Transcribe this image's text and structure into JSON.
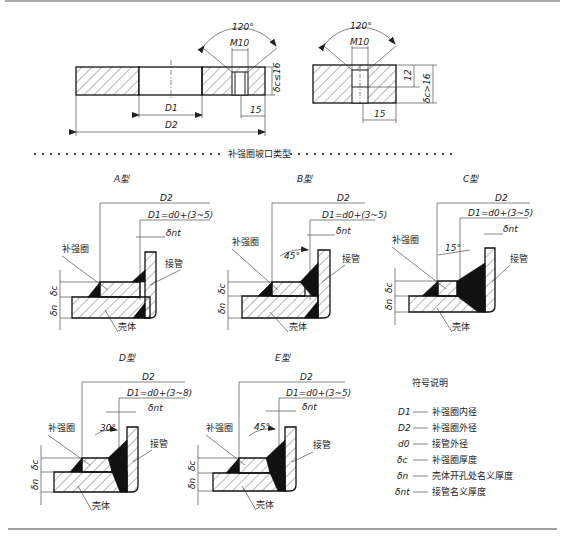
{
  "top_view_1": {
    "angle": "120°",
    "thread": "M10",
    "thickness_label": "δc≤16",
    "inner_dia": "D1",
    "outer_dia": "D2",
    "offset": "15"
  },
  "top_view_2": {
    "angle": "120°",
    "thread": "M10",
    "depth": "12",
    "thickness_label": "δc>16",
    "offset": "15"
  },
  "section_title": "补强圈坡口类型",
  "types": [
    {
      "title": "A型",
      "d2": "D2",
      "d1": "D1=d0+(3~5)",
      "dnt": "δnt",
      "ring": "补强圈",
      "pipe": "接管",
      "shell": "壳体",
      "dc": "δc",
      "dn": "δn",
      "angle": ""
    },
    {
      "title": "B型",
      "d2": "D2",
      "d1": "D1=d0+(3~5)",
      "dnt": "δnt",
      "ring": "补强圈",
      "pipe": "接管",
      "shell": "壳体",
      "dc": "δc",
      "dn": "δn",
      "angle": "45°"
    },
    {
      "title": "C型",
      "d2": "D2",
      "d1": "D1=d0+(3~5)",
      "dnt": "δnt",
      "ring": "补强圈",
      "pipe": "接管",
      "shell": "壳体",
      "dc": "δc",
      "dn": "δn",
      "angle": "15°"
    },
    {
      "title": "D型",
      "d2": "D2",
      "d1": "D1=d0+(3~8)",
      "dnt": "δnt",
      "ring": "补强圈",
      "pipe": "接管",
      "shell": "壳体",
      "dc": "δc",
      "dn": "δn",
      "angle": "30°"
    },
    {
      "title": "E型",
      "d2": "D2",
      "d1": "D1=d0+(3~5)",
      "dnt": "δnt",
      "ring": "补强圈",
      "pipe": "接管",
      "shell": "壳体",
      "dc": "δc",
      "dn": "δn",
      "angle": "45°"
    }
  ],
  "legend": {
    "title": "符号说明",
    "items": [
      {
        "symbol": "D1",
        "desc": "补强圈内径"
      },
      {
        "symbol": "D2",
        "desc": "补强圈外径"
      },
      {
        "symbol": "d0",
        "desc": "接管外径"
      },
      {
        "symbol": "δc",
        "desc": "补强圈厚度"
      },
      {
        "symbol": "δn",
        "desc": "壳体开孔处名义厚度"
      },
      {
        "symbol": "δnt",
        "desc": "接管名义厚度"
      }
    ]
  }
}
